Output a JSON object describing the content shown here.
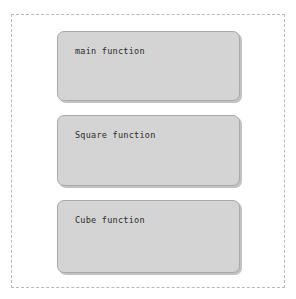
{
  "canvas": {
    "width": 296,
    "height": 299,
    "background_color": "#ffffff"
  },
  "frame": {
    "name": "dashed-container",
    "style": "dashed",
    "border_color": "#b9b9b9"
  },
  "diagram": {
    "type": "block-list",
    "block_fill_color": "#d4d4d4",
    "block_border_color": "#a9a9a9",
    "text_color": "#2b2b2b",
    "blocks": [
      {
        "id": "main",
        "label": "main function"
      },
      {
        "id": "square",
        "label": "Square function"
      },
      {
        "id": "cube",
        "label": "Cube function"
      }
    ]
  }
}
